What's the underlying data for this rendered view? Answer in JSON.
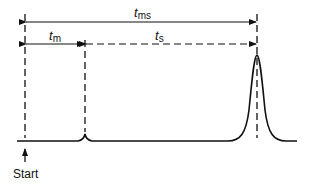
{
  "diagram": {
    "labels": {
      "t_ms": {
        "main": "t",
        "sub": "ms"
      },
      "t_m": {
        "main": "t",
        "sub": "m"
      },
      "t_s": {
        "main": "t",
        "sub": "s"
      },
      "start": "Start"
    },
    "colors": {
      "line": "#111111",
      "background": "#ffffff"
    }
  }
}
